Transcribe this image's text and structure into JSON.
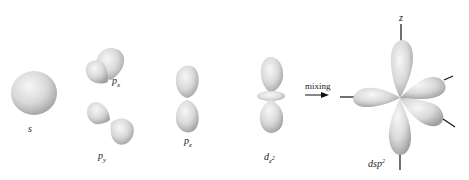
{
  "diagram": {
    "type": "orbital-hybridization",
    "colors": {
      "lobe_light": "#f4f4f4",
      "lobe_dark": "#9c9c9c",
      "axis": "#111111",
      "text": "#222222"
    },
    "labels": {
      "s": "s",
      "px_base": "p",
      "px_sub": "x",
      "py_base": "p",
      "py_sub": "y",
      "pz_base": "p",
      "pz_sub": "z",
      "dz2_base": "d",
      "dz2_sub": "z",
      "dz2_sup": "2",
      "mixing": "mixing",
      "z_axis": "z",
      "hybrid_base": "dsp",
      "hybrid_sup": "2"
    }
  }
}
